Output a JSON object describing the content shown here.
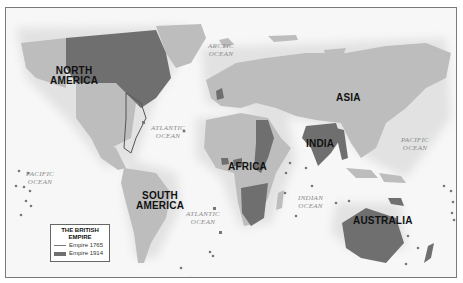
{
  "map": {
    "title": "THE BRITISH EMPIRE",
    "colors": {
      "sea": "#f7f7f7",
      "land": "#bdbdbd",
      "empire_1914": "#6f6f6f",
      "empire_1765_outline": "#777777",
      "coast_halo": "#e6e6e6"
    },
    "continent_labels": [
      {
        "id": "north-america",
        "text": "NORTH AMERICA",
        "line1": "NORTH",
        "line2": "AMERICA"
      },
      {
        "id": "south-america",
        "text": "SOUTH AMERICA",
        "line1": "SOUTH",
        "line2": "AMERICA"
      },
      {
        "id": "africa",
        "text": "AFRICA"
      },
      {
        "id": "asia",
        "text": "ASIA"
      },
      {
        "id": "india",
        "text": "INDIA"
      },
      {
        "id": "australia",
        "text": "AUSTRALIA"
      }
    ],
    "ocean_labels": [
      {
        "id": "arctic",
        "line1": "ARCTIC",
        "line2": "OCEAN"
      },
      {
        "id": "north-atlantic",
        "line1": "ATLANTIC",
        "line2": "OCEAN"
      },
      {
        "id": "south-atlantic",
        "line1": "ATLANTIC",
        "line2": "OCEAN"
      },
      {
        "id": "west-pacific",
        "line1": "PACIFIC",
        "line2": "OCEAN"
      },
      {
        "id": "east-pacific",
        "line1": "PACIFIC",
        "line2": "OCEAN"
      },
      {
        "id": "indian",
        "line1": "INDIAN",
        "line2": "OCEAN"
      }
    ]
  },
  "legend": {
    "title_line1": "THE BRITISH",
    "title_line2": "EMPIRE",
    "items": [
      {
        "label": "Empire 1765",
        "style": "line"
      },
      {
        "label": "Empire 1914",
        "style": "fill"
      }
    ]
  }
}
